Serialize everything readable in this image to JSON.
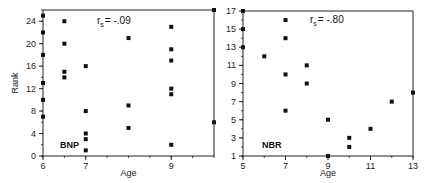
{
  "chart_data": [
    {
      "type": "scatter",
      "panel_label": "BNP",
      "annotation": "r_s = -.09",
      "annotation_main": "r",
      "annotation_sub": "s",
      "annotation_value": "= -.09",
      "xlabel": "Age",
      "ylabel": "Rank",
      "xlim": [
        6,
        10
      ],
      "ylim": [
        0,
        26
      ],
      "xticks": [
        6,
        7,
        9
      ],
      "xtick_labels": [
        "6",
        "7",
        "9"
      ],
      "yticks": [
        0,
        4,
        8,
        12,
        16,
        20,
        24
      ],
      "ytick_labels": [
        "0",
        "4",
        "8",
        "12",
        "16",
        "20",
        "24"
      ],
      "grid": false,
      "points": [
        {
          "x": 6,
          "y": 25
        },
        {
          "x": 6,
          "y": 22
        },
        {
          "x": 6,
          "y": 18
        },
        {
          "x": 6,
          "y": 13
        },
        {
          "x": 6,
          "y": 10
        },
        {
          "x": 6,
          "y": 7
        },
        {
          "x": 6.5,
          "y": 24
        },
        {
          "x": 6.5,
          "y": 20
        },
        {
          "x": 6.5,
          "y": 15
        },
        {
          "x": 6.5,
          "y": 14
        },
        {
          "x": 7,
          "y": 16
        },
        {
          "x": 7,
          "y": 8
        },
        {
          "x": 7,
          "y": 4
        },
        {
          "x": 7,
          "y": 3
        },
        {
          "x": 7,
          "y": 1
        },
        {
          "x": 8,
          "y": 21
        },
        {
          "x": 8,
          "y": 9
        },
        {
          "x": 8,
          "y": 5
        },
        {
          "x": 9,
          "y": 23
        },
        {
          "x": 9,
          "y": 19
        },
        {
          "x": 9,
          "y": 17
        },
        {
          "x": 9,
          "y": 12
        },
        {
          "x": 9,
          "y": 11
        },
        {
          "x": 9,
          "y": 2
        },
        {
          "x": 10,
          "y": 26
        },
        {
          "x": 10,
          "y": 6
        }
      ]
    },
    {
      "type": "scatter",
      "panel_label": "NBR",
      "annotation": "r_s = -.80",
      "annotation_main": "r",
      "annotation_sub": "s",
      "annotation_value": "= -.80",
      "xlabel": "Age",
      "ylabel": "",
      "xlim": [
        5,
        13
      ],
      "ylim": [
        1,
        17
      ],
      "xticks": [
        5,
        7,
        9,
        11,
        13
      ],
      "xtick_labels": [
        "5",
        "7",
        "9",
        "11",
        "13"
      ],
      "yticks": [
        1,
        3,
        5,
        7,
        9,
        11,
        13,
        15,
        17
      ],
      "ytick_labels": [
        "1",
        "3",
        "5",
        "7",
        "9",
        "11",
        "13",
        "15",
        "17"
      ],
      "grid": false,
      "points": [
        {
          "x": 5,
          "y": 17
        },
        {
          "x": 5,
          "y": 15
        },
        {
          "x": 5,
          "y": 13
        },
        {
          "x": 6,
          "y": 12
        },
        {
          "x": 7,
          "y": 16
        },
        {
          "x": 7,
          "y": 14
        },
        {
          "x": 7,
          "y": 10
        },
        {
          "x": 7,
          "y": 6
        },
        {
          "x": 8,
          "y": 11
        },
        {
          "x": 8,
          "y": 9
        },
        {
          "x": 9,
          "y": 5
        },
        {
          "x": 9,
          "y": 1
        },
        {
          "x": 10,
          "y": 3
        },
        {
          "x": 10,
          "y": 2
        },
        {
          "x": 11,
          "y": 4
        },
        {
          "x": 12,
          "y": 7
        },
        {
          "x": 13,
          "y": 8
        }
      ]
    }
  ],
  "style": {
    "axis_color": "#222222",
    "marker_color": "#111111",
    "background": "#ffffff"
  }
}
